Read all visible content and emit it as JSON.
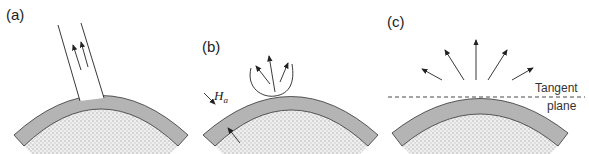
{
  "panels": [
    {
      "id": "a",
      "label": "(a)",
      "description": "beam with two upward arrows entering curved layered surface"
    },
    {
      "id": "b",
      "label": "(b)",
      "description": "lobe-shaped emission pattern with three arrows; layer thickness annotated",
      "thickness_label": "H",
      "thickness_subscript": "a"
    },
    {
      "id": "c",
      "label": "(c)",
      "description": "five radial arrows above a dashed tangent plane",
      "tangent_label_line1": "Tangent",
      "tangent_label_line2": "plane"
    }
  ],
  "colors": {
    "layer": "#b4b4b4",
    "substrate_dots": "#d8d8d8",
    "stroke": "#333333"
  }
}
